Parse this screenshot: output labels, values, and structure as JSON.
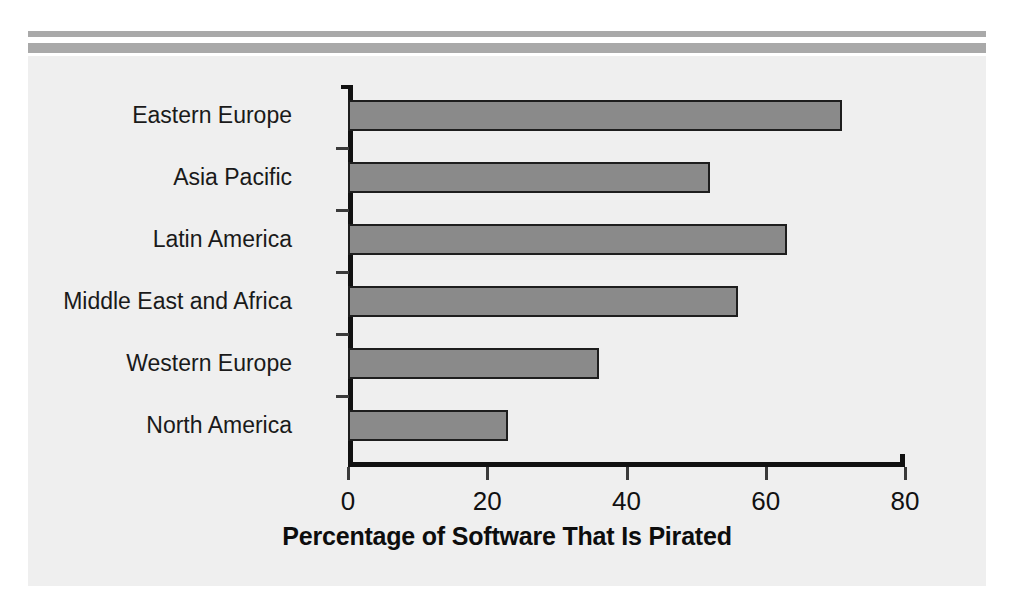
{
  "chart_data": {
    "type": "bar",
    "orientation": "horizontal",
    "title": "",
    "xlabel": "Percentage of Software That Is Pirated",
    "ylabel": "",
    "categories": [
      "Eastern Europe",
      "Asia Pacific",
      "Latin America",
      "Middle East and Africa",
      "Western Europe",
      "North America"
    ],
    "values": [
      71,
      52,
      63,
      56,
      36,
      23
    ],
    "xlim": [
      0,
      80
    ],
    "xticks": [
      0,
      20,
      40,
      60,
      80
    ],
    "xtick_labels": [
      "0",
      "20",
      "40",
      "60",
      "80"
    ],
    "grid": false,
    "legend": null,
    "bar_color": "#8a8a8a",
    "bar_border_color": "#1e1e1e",
    "axis_color": "#111111",
    "panel_background": "#efefef",
    "page_background": "#ffffff",
    "rule_color": "#a9a9a9"
  }
}
